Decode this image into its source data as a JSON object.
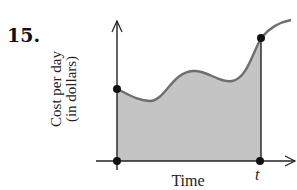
{
  "problem": {
    "number": "15."
  },
  "graph": {
    "y_axis_label_line1": "Cost per day",
    "y_axis_label_line2": "(in dollars)",
    "x_axis_label": "Time",
    "x_marker_label": "t",
    "fill_color": "#c4c4c4",
    "curve_color": "#6e6e6e",
    "axis_color": "#222222",
    "point_color": "#111111",
    "points": [
      {
        "name": "y-intercept",
        "x": 117,
        "y": 89
      },
      {
        "name": "curve-at-t",
        "x": 261,
        "y": 38
      },
      {
        "name": "origin",
        "x": 117,
        "y": 161
      },
      {
        "name": "t-on-axis",
        "x": 260,
        "y": 161
      }
    ]
  }
}
